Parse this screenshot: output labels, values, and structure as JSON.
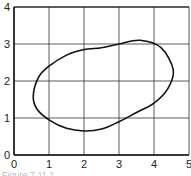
{
  "chart_data": {
    "type": "line",
    "title": "",
    "xlabel": "",
    "ylabel": "",
    "xlim": [
      0,
      5
    ],
    "ylim": [
      0,
      4
    ],
    "grid": true,
    "x_ticks": [
      "0",
      "1",
      "2",
      "3",
      "4",
      "5"
    ],
    "y_ticks": [
      "0",
      "1",
      "2",
      "3",
      "4"
    ],
    "series": [
      {
        "name": "closed curve",
        "closed": true,
        "points": [
          {
            "x": 0.55,
            "y": 1.6
          },
          {
            "x": 0.7,
            "y": 2.1
          },
          {
            "x": 1.0,
            "y": 2.4
          },
          {
            "x": 1.5,
            "y": 2.7
          },
          {
            "x": 2.0,
            "y": 2.85
          },
          {
            "x": 2.5,
            "y": 2.9
          },
          {
            "x": 3.0,
            "y": 3.0
          },
          {
            "x": 3.6,
            "y": 3.1
          },
          {
            "x": 4.2,
            "y": 2.9
          },
          {
            "x": 4.55,
            "y": 2.3
          },
          {
            "x": 4.4,
            "y": 1.8
          },
          {
            "x": 4.0,
            "y": 1.4
          },
          {
            "x": 3.5,
            "y": 1.15
          },
          {
            "x": 3.0,
            "y": 0.9
          },
          {
            "x": 2.5,
            "y": 0.7
          },
          {
            "x": 2.0,
            "y": 0.65
          },
          {
            "x": 1.5,
            "y": 0.72
          },
          {
            "x": 1.0,
            "y": 0.95
          },
          {
            "x": 0.65,
            "y": 1.25
          }
        ]
      }
    ],
    "caption": "Figure 7.11.1"
  }
}
